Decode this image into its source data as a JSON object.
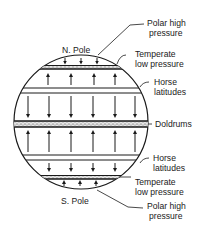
{
  "diagram": {
    "poles": {
      "north": "N. Pole",
      "south": "S. Pole"
    },
    "labels": {
      "polar_high_n": [
        "Polar high",
        "pressure"
      ],
      "temperate_low_n": [
        "Temperate",
        "low pressure"
      ],
      "horse_lat_n": [
        "Horse",
        "latitudes"
      ],
      "doldrums": "Doldrums",
      "horse_lat_s": [
        "Horse",
        "latitudes"
      ],
      "temperate_low_s": [
        "Temperate",
        "low pressure"
      ],
      "polar_high_s": [
        "Polar high",
        "pressure"
      ]
    },
    "colors": {
      "ink": "#1a1a1a",
      "background": "#ffffff",
      "band_fill": "#d9d9d9"
    }
  }
}
